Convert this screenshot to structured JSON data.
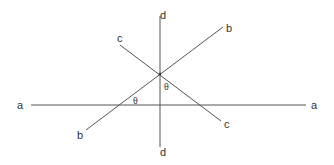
{
  "diagram": {
    "type": "geometry-lines",
    "lines": [
      {
        "id": "a",
        "label_start": "a",
        "label_end": "a",
        "orientation": "horizontal"
      },
      {
        "id": "b",
        "label_start": "b",
        "label_end": "b",
        "orientation": "diagonal-up"
      },
      {
        "id": "c",
        "label_start": "c",
        "label_end": "c",
        "orientation": "diagonal-down"
      },
      {
        "id": "d",
        "label_start": "d",
        "label_end": "d",
        "orientation": "vertical"
      }
    ],
    "angles": [
      {
        "label": "θ",
        "between": [
          "a",
          "b"
        ]
      },
      {
        "label": "θ",
        "between": [
          "d",
          "c"
        ]
      }
    ],
    "colors": {
      "line": "#555555",
      "text": "#333333",
      "background": "#ffffff"
    }
  }
}
